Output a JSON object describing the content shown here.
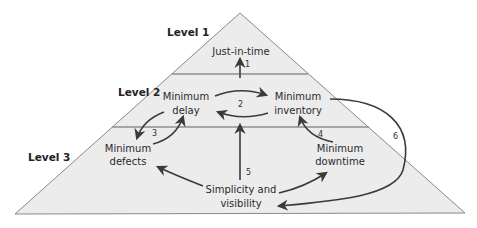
{
  "diagram": {
    "type": "pyramid",
    "colors": {
      "fill": "#ececec",
      "edge": "#8a8a8a",
      "arrow": "#3a3a3a",
      "text": "#2a2a2a"
    },
    "levels": [
      {
        "label": "Level 1"
      },
      {
        "label": "Level 2"
      },
      {
        "label": "Level 3"
      }
    ],
    "nodes": {
      "jit": {
        "lines": [
          "Just-in-time"
        ]
      },
      "delay": {
        "lines": [
          "Minimum",
          "delay"
        ]
      },
      "inventory": {
        "lines": [
          "Minimum",
          "inventory"
        ]
      },
      "defects": {
        "lines": [
          "Minimum",
          "defects"
        ]
      },
      "downtime": {
        "lines": [
          "Minimum",
          "downtime"
        ]
      },
      "simplicity": {
        "lines": [
          "Simplicity and",
          "visibility"
        ]
      }
    },
    "links": [
      {
        "number": "1",
        "from": "Level 2 divider",
        "to": "Just-in-time"
      },
      {
        "number": "2",
        "from": "Minimum delay",
        "to": "Minimum inventory",
        "bidirectional": true
      },
      {
        "number": "3",
        "from": "Minimum defects",
        "to": "Minimum delay",
        "bidirectional": true
      },
      {
        "number": "4",
        "from": "Minimum downtime",
        "to": "Minimum inventory"
      },
      {
        "number": "5",
        "from": "Simplicity and visibility",
        "to": "Level 2 divider"
      },
      {
        "number": "6",
        "from": "Minimum inventory",
        "to": "Simplicity and visibility"
      }
    ],
    "extra_arrows": [
      {
        "from": "Simplicity and visibility",
        "to": "Minimum defects"
      },
      {
        "from": "Simplicity and visibility",
        "to": "Minimum downtime"
      }
    ]
  }
}
